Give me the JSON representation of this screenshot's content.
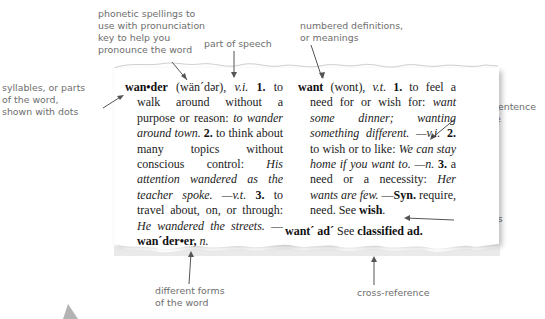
{
  "callouts": {
    "phonetic": [
      "phonetic spellings to",
      "use with pronunciation",
      "key to help you",
      "pronounce the word"
    ],
    "part_of_speech": "part of speech",
    "numbered": [
      "numbered definitions,",
      "or meanings"
    ],
    "syllables": [
      "syllables, or parts",
      "of the word,",
      "shown with dots"
    ],
    "sample": [
      "sample sentence",
      "or phrase"
    ],
    "synonyms": "synonyms",
    "different_forms": [
      "different forms",
      "of the word"
    ],
    "cross_reference": "cross-reference"
  },
  "entries": {
    "wander": {
      "headword": "wan•der",
      "pron": " (wän´dər), ",
      "pos1": "v.i.",
      "n1": " 1.",
      "def1": " to walk around without a purpose or reason: ",
      "ex1": "to wander around town.",
      "n2": " 2.",
      "def2": " to think about many topics without conscious control: ",
      "ex2": "His attention wandered as the teacher spoke.",
      "pos2": " —v.t.",
      "n3": " 3.",
      "def3": " to travel about, on, or through: ",
      "ex3": "He wandered the streets.",
      "dash": " —",
      "form": "wan´der•er,",
      "form_pos": " n."
    },
    "want": {
      "headword": "want",
      "pron": " (wont), ",
      "pos1": "v.t.",
      "n1": " 1.",
      "def1": " to feel a need for or wish for: ",
      "ex1": "want some dinner; wanting something different.",
      "pos2": " —v.i.",
      "n2": " 2.",
      "def2": " to wish or to like: ",
      "ex2": "We can stay home if you want to.",
      "pos3": " —n.",
      "n3": " 3.",
      "def3": " a need or a necessity: ",
      "ex3": "Her wants are few.",
      "syn_dash": " —",
      "syn_label": "Syn.",
      "syn_list": " require, need.",
      "see_label": " See ",
      "see_word": "wish",
      "see_end": "."
    },
    "want_ad": {
      "headword": "want´ ad´",
      "see_label": " See ",
      "target": "classified ad."
    }
  }
}
